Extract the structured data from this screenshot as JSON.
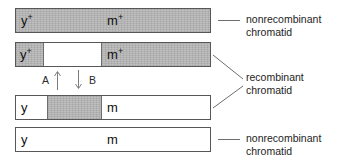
{
  "figure": {
    "gray_fill_color": "#b9b9b9",
    "outline_color": "#55585a",
    "text_color": "#1a1a1a"
  },
  "chromatids": [
    {
      "id": "chromatid-1",
      "type": "nonrecombinant",
      "left_allele": "y",
      "left_allele_superscript": "+",
      "right_allele": "m",
      "right_allele_superscript": "+",
      "segments": [
        {
          "fill": "gray",
          "width_pct": 100
        }
      ]
    },
    {
      "id": "chromatid-2",
      "type": "recombinant",
      "left_allele": "y",
      "left_allele_superscript": "+",
      "right_allele": "m",
      "right_allele_superscript": "+",
      "segments": [
        {
          "fill": "gray",
          "width_pct": 14
        },
        {
          "fill": "white",
          "width_pct": 30
        },
        {
          "fill": "gray",
          "width_pct": 56
        }
      ]
    },
    {
      "id": "chromatid-3",
      "type": "recombinant",
      "left_allele": "y",
      "left_allele_superscript": "",
      "right_allele": "m",
      "right_allele_superscript": "",
      "segments": [
        {
          "fill": "white",
          "width_pct": 16
        },
        {
          "fill": "gray",
          "width_pct": 28
        },
        {
          "fill": "white",
          "width_pct": 56
        }
      ]
    },
    {
      "id": "chromatid-4",
      "type": "nonrecombinant",
      "left_allele": "y",
      "left_allele_superscript": "",
      "right_allele": "m",
      "right_allele_superscript": "",
      "segments": [
        {
          "fill": "white",
          "width_pct": 100
        }
      ]
    }
  ],
  "crossover": {
    "left_label": "A",
    "right_label": "B",
    "up_arrow_icon": "arrow-up-icon",
    "down_arrow_icon": "arrow-down-icon"
  },
  "callouts": [
    {
      "id": "callout-top",
      "line1": "nonrecombinant",
      "line2": "chromatid"
    },
    {
      "id": "callout-middle",
      "line1": "recombinant",
      "line2": "chromatid"
    },
    {
      "id": "callout-bottom",
      "line1": "nonrecombinant",
      "line2": "chromatid"
    }
  ]
}
